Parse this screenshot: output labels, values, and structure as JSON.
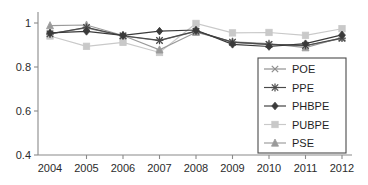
{
  "chart_data": {
    "type": "line",
    "title": "",
    "xlabel": "",
    "ylabel": "",
    "categories": [
      2004,
      2005,
      2006,
      2007,
      2008,
      2009,
      2010,
      2011,
      2012
    ],
    "x_tick_labels": [
      "2004",
      "2005",
      "2006",
      "2007",
      "2008",
      "2009",
      "2010",
      "2011",
      "2012"
    ],
    "y_tick_labels": [
      "0.4",
      "0.6",
      "0.8",
      "1"
    ],
    "y_ticks": [
      0.4,
      0.6,
      0.8,
      1.0
    ],
    "ylim": [
      0.4,
      1.05
    ],
    "xlim": [
      2003.6,
      2012.4
    ],
    "grid": false,
    "legend_position": "lower-right-inside",
    "series": [
      {
        "name": "POE",
        "marker": "x-cross",
        "color": "#8d8d8d",
        "values": [
          0.952,
          0.978,
          0.941,
          0.92,
          0.962,
          0.912,
          0.902,
          0.896,
          0.93
        ]
      },
      {
        "name": "PPE",
        "marker": "asterisk",
        "color": "#4a4a4a",
        "values": [
          0.95,
          0.98,
          0.942,
          0.921,
          0.963,
          0.913,
          0.903,
          0.898,
          0.931
        ]
      },
      {
        "name": "PHBPE",
        "marker": "diamond",
        "color": "#3a3a3a",
        "values": [
          0.955,
          0.962,
          0.944,
          0.963,
          0.968,
          0.903,
          0.893,
          0.906,
          0.946
        ]
      },
      {
        "name": "PUBPE",
        "marker": "square",
        "color": "#c9c9c9",
        "values": [
          0.941,
          0.894,
          0.912,
          0.866,
          0.998,
          0.955,
          0.957,
          0.944,
          0.974
        ]
      },
      {
        "name": "PSE",
        "marker": "triangle",
        "color": "#9a9a9a",
        "values": [
          0.988,
          0.991,
          0.943,
          0.878,
          0.958,
          0.915,
          0.906,
          0.888,
          0.934
        ]
      }
    ]
  },
  "legend": {
    "entries": [
      {
        "label": "POE"
      },
      {
        "label": "PPE"
      },
      {
        "label": "PHBPE"
      },
      {
        "label": "PUBPE"
      },
      {
        "label": "PSE"
      }
    ]
  }
}
